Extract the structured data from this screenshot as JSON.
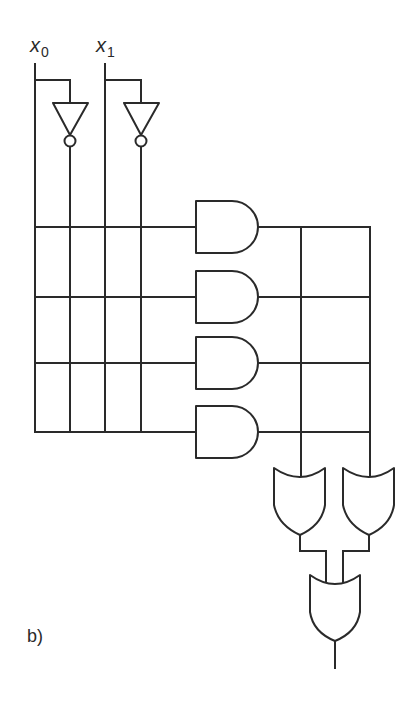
{
  "figure": {
    "caption": "b)",
    "type": "programmable-logic-array",
    "stroke_color": "#2a2a2a",
    "background": "#ffffff"
  },
  "inputs": [
    {
      "var": "x",
      "sub": "0"
    },
    {
      "var": "x",
      "sub": "1"
    }
  ],
  "components": {
    "inverters": 2,
    "and_gates": 4,
    "or_gates_first_stage": 2,
    "or_gates_final": 1,
    "product_lines": 4,
    "input_lines": 4
  }
}
